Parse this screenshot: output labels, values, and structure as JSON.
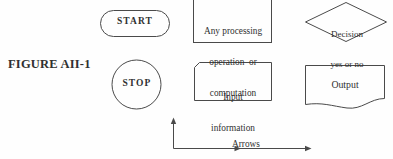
{
  "figure": {
    "label": "FIGURE AII-1",
    "background_color": "#fefefe",
    "stroke_color": "#4a4a4a",
    "text_color": "#303030"
  },
  "shapes": {
    "start": {
      "symbol": "terminator-capsule",
      "label": "START"
    },
    "stop": {
      "symbol": "terminator-circle",
      "label": "STOP"
    },
    "process": {
      "symbol": "process-rectangle",
      "line1": "Any processing",
      "line2": "operation  or",
      "line3": "computation"
    },
    "decision": {
      "symbol": "decision-diamond",
      "line1": "Decision",
      "line2": "yes or no"
    },
    "input": {
      "symbol": "input-clipped-corner-box",
      "line1": "Input",
      "line2": "information"
    },
    "output": {
      "symbol": "output-document-wavy",
      "label": "Output"
    }
  },
  "legend": {
    "arrows_line1": "Arrows",
    "arrows_line2": "indicate flow of directions"
  }
}
